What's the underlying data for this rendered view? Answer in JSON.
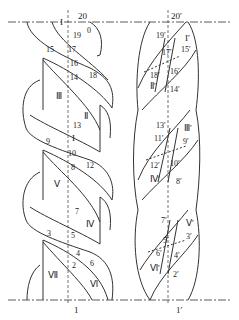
{
  "left_strand": {
    "top_label": "20",
    "bottom_label": "1",
    "numbers": [
      {
        "t": "19",
        "x": 73,
        "y": 38
      },
      {
        "t": "0",
        "x": 87,
        "y": 33
      },
      {
        "t": "17",
        "x": 68,
        "y": 52
      },
      {
        "t": "15",
        "x": 46,
        "y": 52
      },
      {
        "t": "16",
        "x": 70,
        "y": 66
      },
      {
        "t": "18",
        "x": 89,
        "y": 78
      },
      {
        "t": "14",
        "x": 70,
        "y": 80
      },
      {
        "t": "13",
        "x": 73,
        "y": 128
      },
      {
        "t": "9",
        "x": 46,
        "y": 144
      },
      {
        "t": "10",
        "x": 68,
        "y": 156
      },
      {
        "t": "12",
        "x": 86,
        "y": 168
      },
      {
        "t": "8",
        "x": 71,
        "y": 170
      },
      {
        "t": "7",
        "x": 75,
        "y": 214
      },
      {
        "t": "3",
        "x": 47,
        "y": 236
      },
      {
        "t": "5",
        "x": 71,
        "y": 238
      },
      {
        "t": "4",
        "x": 76,
        "y": 256
      },
      {
        "t": "6",
        "x": 90,
        "y": 266
      },
      {
        "t": "2",
        "x": 72,
        "y": 268
      }
    ],
    "romans": [
      {
        "t": "I",
        "x": 60,
        "y": 24
      },
      {
        "t": "Ⅲ",
        "x": 56,
        "y": 98
      },
      {
        "t": "Ⅱ",
        "x": 84,
        "y": 118
      },
      {
        "t": "I",
        "x": 72,
        "y": 140
      },
      {
        "t": "Ⅴ",
        "x": 54,
        "y": 186
      },
      {
        "t": "Ⅳ",
        "x": 86,
        "y": 226
      },
      {
        "t": "Ⅶ",
        "x": 48,
        "y": 277
      },
      {
        "t": "Ⅵ",
        "x": 90,
        "y": 286
      }
    ]
  },
  "right_strand": {
    "top_label": "20′",
    "bottom_label": "1′",
    "numbers": [
      {
        "t": "19′",
        "x": 156,
        "y": 38
      },
      {
        "t": "17′",
        "x": 162,
        "y": 55
      },
      {
        "t": "15′",
        "x": 181,
        "y": 52
      },
      {
        "t": "18′",
        "x": 150,
        "y": 78
      },
      {
        "t": "16′",
        "x": 170,
        "y": 74
      },
      {
        "t": "14′",
        "x": 170,
        "y": 92
      },
      {
        "t": "13′",
        "x": 156,
        "y": 128
      },
      {
        "t": "11′",
        "x": 154,
        "y": 141
      },
      {
        "t": "9′",
        "x": 183,
        "y": 144
      },
      {
        "t": "12′",
        "x": 150,
        "y": 168
      },
      {
        "t": "10′",
        "x": 170,
        "y": 166
      },
      {
        "t": "8′",
        "x": 176,
        "y": 184
      },
      {
        "t": "7′",
        "x": 161,
        "y": 223
      },
      {
        "t": "5′",
        "x": 163,
        "y": 243
      },
      {
        "t": "3′",
        "x": 186,
        "y": 239
      },
      {
        "t": "6′",
        "x": 156,
        "y": 256
      },
      {
        "t": "4′",
        "x": 174,
        "y": 258
      },
      {
        "t": "2′",
        "x": 173,
        "y": 277
      }
    ],
    "romans": [
      {
        "t": "I′",
        "x": 185,
        "y": 40
      },
      {
        "t": "Ⅱ′",
        "x": 150,
        "y": 88
      },
      {
        "t": "Ⅲ′",
        "x": 184,
        "y": 130
      },
      {
        "t": "Ⅳ′",
        "x": 150,
        "y": 181
      },
      {
        "t": "Ⅴ′",
        "x": 186,
        "y": 225
      },
      {
        "t": "Ⅵ′",
        "x": 150,
        "y": 270
      }
    ]
  }
}
